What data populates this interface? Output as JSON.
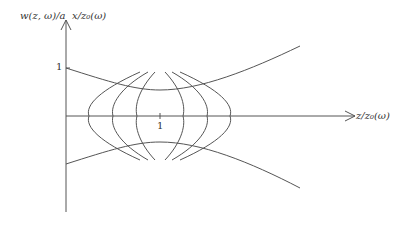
{
  "diagram": {
    "type": "gaussian-beam-wavefronts",
    "labels": {
      "y_axis_left": "w(z, ω)/a",
      "y_axis_right": "x/z₀(ω)",
      "x_axis": "z/z₀(ω)",
      "y_tick": "1",
      "x_tick": "1"
    },
    "colors": {
      "line": "#555555",
      "text": "#333333",
      "background": "#ffffff"
    },
    "elements": {
      "beam_envelope": "hyperbolic upper and lower curves, waist at z/z0 = 1",
      "wavefronts": 6,
      "wavefront_axis_crossings_px": [
        89,
        113,
        137,
        183,
        207,
        230
      ]
    }
  }
}
